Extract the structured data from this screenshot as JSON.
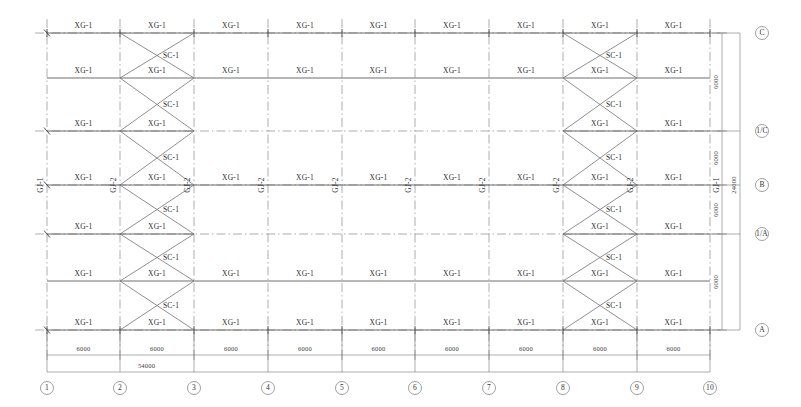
{
  "drawing": {
    "title": "Roof Bracing and Purlin Layout Plan",
    "total_span_label": "54000",
    "total_depth_label": "24000"
  },
  "labels": {
    "purlin": "XG-1",
    "purlin_alt": "XG-2",
    "brace": "SC-1",
    "frame_end": "GJ-1",
    "frame_mid": "GJ-2"
  },
  "grid": {
    "columns": [
      {
        "id": "1",
        "x": 47,
        "label": "1"
      },
      {
        "id": "2",
        "x": 120,
        "label": "2"
      },
      {
        "id": "3",
        "x": 194,
        "label": "3"
      },
      {
        "id": "4",
        "x": 268,
        "label": "4"
      },
      {
        "id": "5",
        "x": 342,
        "label": "5"
      },
      {
        "id": "6",
        "x": 415,
        "label": "6"
      },
      {
        "id": "7",
        "x": 489,
        "label": "7"
      },
      {
        "id": "8",
        "x": 563,
        "label": "8"
      },
      {
        "id": "9",
        "x": 637,
        "label": "9"
      },
      {
        "id": "10",
        "x": 710,
        "label": "10"
      }
    ],
    "rows": [
      {
        "id": "C",
        "y": 33,
        "label": "C",
        "axis": true
      },
      {
        "id": "rC",
        "y": 78,
        "label": "",
        "axis": false
      },
      {
        "id": "Cp",
        "y": 131,
        "label": "1/C",
        "axis": true
      },
      {
        "id": "B",
        "y": 185,
        "label": "B",
        "axis": true
      },
      {
        "id": "Ap",
        "y": 234,
        "label": "1/A",
        "axis": true
      },
      {
        "id": "rA",
        "y": 281,
        "label": "",
        "axis": false
      },
      {
        "id": "A",
        "y": 330,
        "label": "A",
        "axis": true
      }
    ]
  },
  "bay_dimensions": {
    "horizontal": [
      "6000",
      "6000",
      "6000",
      "6000",
      "6000",
      "6000",
      "6000",
      "6000",
      "6000"
    ],
    "vertical": [
      "6000",
      "6000",
      "6000",
      "6000"
    ],
    "overall_horizontal": "54000",
    "overall_vertical": "24000"
  },
  "braced_bays": [
    {
      "from_column": "2",
      "to_column": "3"
    },
    {
      "from_column": "8",
      "to_column": "9"
    }
  ],
  "notes": {
    "brace_count_per_bay": 6,
    "purlin_rows": 7
  }
}
